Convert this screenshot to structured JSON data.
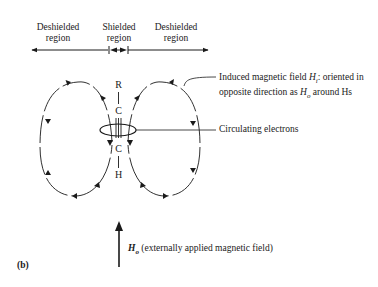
{
  "regions": [
    {
      "label_line1": "Deshielded",
      "label_line2": "region"
    },
    {
      "label_line1": "Shielded",
      "label_line2": "region"
    },
    {
      "label_line1": "Deshielded",
      "label_line2": "region"
    }
  ],
  "molecule": {
    "top_atom": "R",
    "carbon_top": "C",
    "carbon_bottom": "C",
    "bottom_atom": "H",
    "bond": "triple"
  },
  "annotations": {
    "induced_field_line1_prefix": "Induced magnetic field ",
    "induced_field_symbol": "H",
    "induced_field_subscript": "i",
    "induced_field_line1_suffix": ": oriented in",
    "induced_field_line2_prefix": "opposite direction as ",
    "induced_field_line2_symbol": "H",
    "induced_field_line2_subscript": "o",
    "induced_field_line2_suffix": " around Hs",
    "circulating_electrons": "Circulating electrons",
    "applied_field_symbol": "H",
    "applied_field_subscript": "o",
    "applied_field_text": " (externally applied magnetic field)"
  },
  "figure_label": "(b)"
}
